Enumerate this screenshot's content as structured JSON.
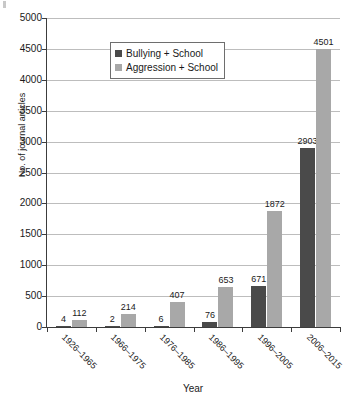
{
  "chart_data": {
    "type": "bar",
    "title": "",
    "subtitle": "",
    "xlabel": "Year",
    "ylabel": "No. of journal articles",
    "ylim": [
      0,
      5000
    ],
    "ytick_step": 500,
    "yticks": [
      5000,
      4500,
      4000,
      3500,
      3000,
      2500,
      2000,
      1500,
      1000,
      500,
      0
    ],
    "grid": true,
    "grid_axis": "y",
    "legend_position": "top-left-inside",
    "categories": [
      "1926–1965",
      "1966–1975",
      "1976–1985",
      "1986–1995",
      "1996–2005",
      "2006–2015"
    ],
    "series": [
      {
        "name": "Bullying + School",
        "color": "#4a4a4a",
        "values": [
          4,
          2,
          6,
          76,
          671,
          2903
        ],
        "labels": [
          "4",
          "2",
          "6",
          "76",
          "671",
          "2903"
        ]
      },
      {
        "name": "Aggression + School",
        "color": "#a8a8a8",
        "values": [
          112,
          214,
          407,
          653,
          1872,
          4501
        ],
        "labels": [
          "112",
          "214",
          "407",
          "653",
          "1872",
          "4501"
        ]
      }
    ]
  },
  "legend": {
    "entries": [
      {
        "label": "Bullying + School",
        "color": "#4a4a4a"
      },
      {
        "label": "Aggression + School",
        "color": "#a8a8a8"
      }
    ]
  },
  "axes": {
    "y": {
      "title": "No. of journal articles",
      "tick_labels": [
        "5000",
        "4500",
        "4000",
        "3500",
        "3000",
        "2500",
        "2000",
        "1500",
        "1000",
        "500",
        "0"
      ]
    },
    "x": {
      "title": "Year",
      "tick_labels": [
        "1926–1965",
        "1966–1975",
        "1976–1985",
        "1986–1995",
        "1996–2005",
        "2006–2015"
      ]
    }
  },
  "colors": {
    "series_a": "#4a4a4a",
    "series_b": "#a8a8a8",
    "grid": "#bdbdbd",
    "axis": "#3c3c3c",
    "text": "#1a1a1a",
    "background": "#ffffff"
  }
}
